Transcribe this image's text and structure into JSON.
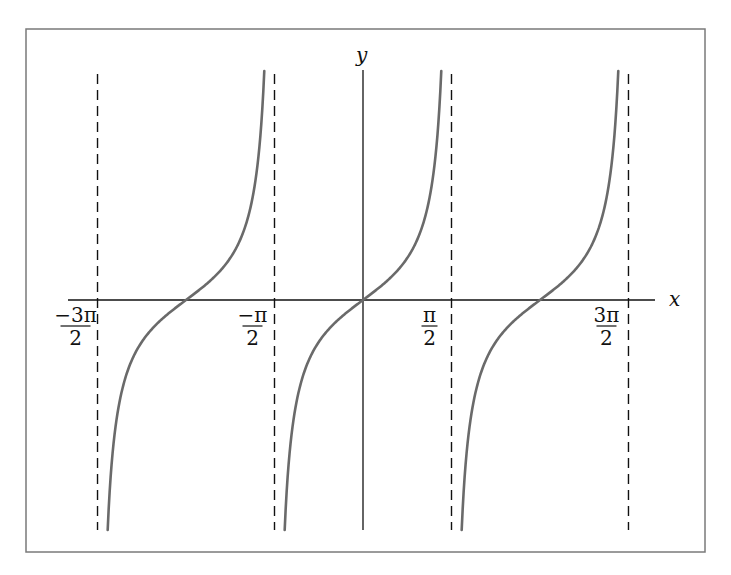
{
  "chart_data": {
    "type": "line",
    "title": "",
    "function": "y = tan(x)",
    "xlabel": "x",
    "ylabel": "y",
    "xlim": [
      -2.05,
      3.3
    ],
    "grid": false,
    "legend": null,
    "x_ticks": [
      {
        "value": -4.712,
        "numerator": "−3π",
        "denominator": "2"
      },
      {
        "value": -1.5708,
        "numerator": "−π",
        "denominator": "2"
      },
      {
        "value": 1.5708,
        "numerator": "π",
        "denominator": "2"
      },
      {
        "value": 4.712,
        "numerator": "3π",
        "denominator": "2"
      }
    ],
    "asymptotes": [
      -4.712,
      -1.5708,
      1.5708,
      4.712
    ],
    "series": [
      {
        "name": "tan(x) branch 1",
        "x_range": [
          -4.712,
          -1.5708
        ],
        "zero_at": -3.1416
      },
      {
        "name": "tan(x) branch 2",
        "x_range": [
          -1.5708,
          1.5708
        ],
        "zero_at": 0
      },
      {
        "name": "tan(x) branch 3",
        "x_range": [
          1.5708,
          4.712
        ],
        "zero_at": 3.1416
      }
    ],
    "sample_points": [
      {
        "x": -0.785,
        "y": -1
      },
      {
        "x": 0,
        "y": 0
      },
      {
        "x": 0.785,
        "y": 1
      },
      {
        "x": -2.356,
        "y": 1
      },
      {
        "x": -3.927,
        "y": -1
      },
      {
        "x": 2.356,
        "y": -1
      },
      {
        "x": 3.927,
        "y": 1
      }
    ],
    "colors": {
      "curve": "#6a6a6a",
      "axes": "#111111",
      "asymptotes": "#111111",
      "frame": "#7a7a7a"
    }
  },
  "labels": {
    "x_axis": "x",
    "y_axis": "y"
  }
}
